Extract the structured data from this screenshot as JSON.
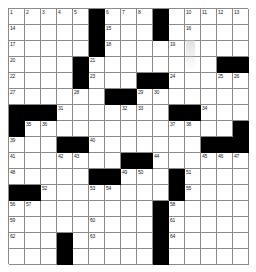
{
  "puzzle": {
    "title": "Crossword Grid",
    "columns": 15,
    "rows": 16,
    "cell_size_px": 16,
    "colors": {
      "block": "#000000",
      "empty": "#ffffff",
      "grid_line": "#8a8a8a",
      "number_text": "#222222"
    },
    "block_cells": [
      [
        1,
        6
      ],
      [
        1,
        10
      ],
      [
        2,
        6
      ],
      [
        2,
        10
      ],
      [
        3,
        6
      ],
      [
        4,
        5
      ],
      [
        4,
        14
      ],
      [
        4,
        15
      ],
      [
        5,
        5
      ],
      [
        5,
        9
      ],
      [
        5,
        10
      ],
      [
        6,
        7
      ],
      [
        6,
        8
      ],
      [
        7,
        1
      ],
      [
        7,
        2
      ],
      [
        7,
        3
      ],
      [
        7,
        11
      ],
      [
        7,
        12
      ],
      [
        8,
        1
      ],
      [
        8,
        15
      ],
      [
        9,
        4
      ],
      [
        9,
        5
      ],
      [
        9,
        13
      ],
      [
        9,
        14
      ],
      [
        9,
        15
      ],
      [
        10,
        8
      ],
      [
        10,
        9
      ],
      [
        11,
        6
      ],
      [
        11,
        7
      ],
      [
        11,
        11
      ],
      [
        12,
        1
      ],
      [
        12,
        2
      ],
      [
        12,
        11
      ],
      [
        13,
        10
      ],
      [
        14,
        10
      ],
      [
        15,
        4
      ],
      [
        15,
        10
      ],
      [
        16,
        4
      ],
      [
        16,
        10
      ]
    ],
    "numbered_cells": [
      {
        "number": 1,
        "row": 1,
        "col": 1
      },
      {
        "number": 2,
        "row": 1,
        "col": 2
      },
      {
        "number": 3,
        "row": 1,
        "col": 3
      },
      {
        "number": 4,
        "row": 1,
        "col": 4
      },
      {
        "number": 5,
        "row": 1,
        "col": 5
      },
      {
        "number": 6,
        "row": 1,
        "col": 7
      },
      {
        "number": 7,
        "row": 1,
        "col": 8
      },
      {
        "number": 8,
        "row": 1,
        "col": 9
      },
      {
        "number": 9,
        "row": 1,
        "col": 10
      },
      {
        "number": 10,
        "row": 1,
        "col": 12
      },
      {
        "number": 11,
        "row": 1,
        "col": 13
      },
      {
        "number": 12,
        "row": 1,
        "col": 14
      },
      {
        "number": 13,
        "row": 1,
        "col": 15
      },
      {
        "number": 14,
        "row": 2,
        "col": 1
      },
      {
        "number": 15,
        "row": 2,
        "col": 7
      },
      {
        "number": 16,
        "row": 2,
        "col": 12
      },
      {
        "number": 17,
        "row": 3,
        "col": 1
      },
      {
        "number": 18,
        "row": 3,
        "col": 7
      },
      {
        "number": 19,
        "row": 3,
        "col": 11
      },
      {
        "number": 20,
        "row": 4,
        "col": 1
      },
      {
        "number": 21,
        "row": 4,
        "col": 6
      },
      {
        "number": 22,
        "row": 5,
        "col": 1
      },
      {
        "number": 23,
        "row": 5,
        "col": 6
      },
      {
        "number": 24,
        "row": 5,
        "col": 11
      },
      {
        "number": 25,
        "row": 5,
        "col": 14
      },
      {
        "number": 26,
        "row": 5,
        "col": 15
      },
      {
        "number": 27,
        "row": 6,
        "col": 1
      },
      {
        "number": 28,
        "row": 6,
        "col": 5
      },
      {
        "number": 29,
        "row": 6,
        "col": 9
      },
      {
        "number": 30,
        "row": 6,
        "col": 10
      },
      {
        "number": 31,
        "row": 7,
        "col": 4
      },
      {
        "number": 32,
        "row": 7,
        "col": 8
      },
      {
        "number": 33,
        "row": 7,
        "col": 9
      },
      {
        "number": 34,
        "row": 7,
        "col": 13
      },
      {
        "number": 35,
        "row": 8,
        "col": 2
      },
      {
        "number": 36,
        "row": 8,
        "col": 3
      },
      {
        "number": 37,
        "row": 8,
        "col": 11
      },
      {
        "number": 38,
        "row": 8,
        "col": 12
      },
      {
        "number": 39,
        "row": 9,
        "col": 1
      },
      {
        "number": 40,
        "row": 9,
        "col": 6
      },
      {
        "number": 41,
        "row": 10,
        "col": 1
      },
      {
        "number": 42,
        "row": 10,
        "col": 4
      },
      {
        "number": 43,
        "row": 10,
        "col": 5
      },
      {
        "number": 44,
        "row": 10,
        "col": 10
      },
      {
        "number": 45,
        "row": 10,
        "col": 13
      },
      {
        "number": 46,
        "row": 10,
        "col": 14
      },
      {
        "number": 47,
        "row": 10,
        "col": 15
      },
      {
        "number": 48,
        "row": 11,
        "col": 1
      },
      {
        "number": 49,
        "row": 11,
        "col": 8
      },
      {
        "number": 50,
        "row": 11,
        "col": 9
      },
      {
        "number": 51,
        "row": 11,
        "col": 12
      },
      {
        "number": 52,
        "row": 12,
        "col": 3
      },
      {
        "number": 53,
        "row": 12,
        "col": 6
      },
      {
        "number": 54,
        "row": 12,
        "col": 7
      },
      {
        "number": 55,
        "row": 12,
        "col": 12
      },
      {
        "number": 56,
        "row": 13,
        "col": 1
      },
      {
        "number": 57,
        "row": 13,
        "col": 2
      },
      {
        "number": 58,
        "row": 13,
        "col": 11
      },
      {
        "number": 59,
        "row": 14,
        "col": 1
      },
      {
        "number": 60,
        "row": 14,
        "col": 6
      },
      {
        "number": 61,
        "row": 14,
        "col": 11
      },
      {
        "number": 62,
        "row": 15,
        "col": 1
      },
      {
        "number": 63,
        "row": 15,
        "col": 6
      },
      {
        "number": 64,
        "row": 15,
        "col": 11
      }
    ],
    "letters": []
  }
}
